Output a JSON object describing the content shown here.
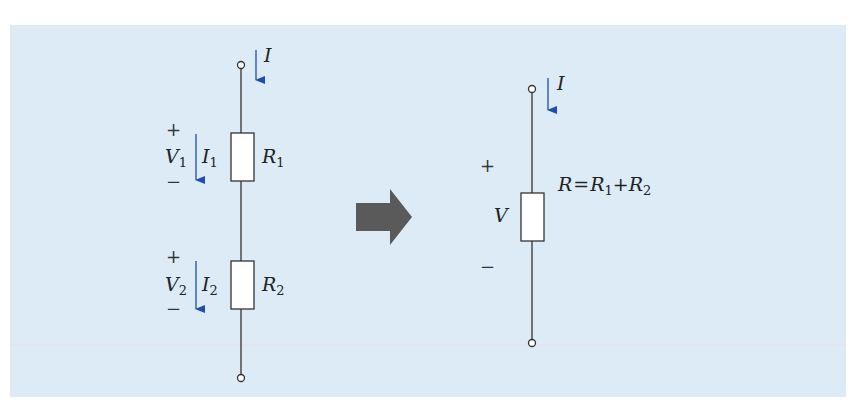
{
  "diagram": {
    "colors": {
      "background": "#ddebf7",
      "wire": "#333333",
      "current_arrow": "#1f4fa8",
      "transform_arrow": "#5a5a5a",
      "resistor_fill": "#ffffff"
    },
    "left_circuit": {
      "current_label": "I",
      "resistor_1": {
        "label": "R",
        "label_sub": "1",
        "voltage_label": "V",
        "voltage_sub": "1",
        "current_label": "I",
        "current_sub": "1",
        "plus": "+",
        "minus": "−"
      },
      "resistor_2": {
        "label": "R",
        "label_sub": "2",
        "voltage_label": "V",
        "voltage_sub": "2",
        "current_label": "I",
        "current_sub": "2",
        "plus": "+",
        "minus": "−"
      }
    },
    "right_circuit": {
      "current_label": "I",
      "voltage_label": "V",
      "plus": "+",
      "minus": "−",
      "equation": {
        "lhs": "R",
        "eq": "=",
        "t1": "R",
        "t1_sub": "1",
        "plus": "+",
        "t2": "R",
        "t2_sub": "2"
      }
    }
  }
}
